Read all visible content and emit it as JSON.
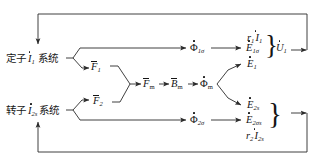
{
  "diagram": {
    "stroke_color": "#2b2b2b",
    "text_color": "#151515",
    "background": "#ffffff",
    "nodes": {
      "stator_system": {
        "label_prefix": "定子",
        "label_symbol": "I",
        "label_sub": "1",
        "label_suffix": "系统",
        "name": "stator-system-block"
      },
      "rotor_system": {
        "label_prefix": "转子",
        "label_symbol": "I",
        "label_sub": "2s",
        "label_suffix": "系统",
        "name": "rotor-system-block"
      },
      "f1": {
        "symbol": "F",
        "sub": "1"
      },
      "f2": {
        "symbol": "F",
        "sub": "2"
      },
      "fm": {
        "symbol": "F",
        "sub": "m"
      },
      "bm": {
        "symbol": "B",
        "sub": "m"
      },
      "phim": {
        "symbol": "Φ",
        "sub": "m"
      },
      "phi1s": {
        "symbol": "Φ",
        "sub": "1σ"
      },
      "phi2s": {
        "symbol": "Φ",
        "sub": "2σ"
      },
      "e1": {
        "symbol": "E",
        "sub": "1"
      },
      "e1s": {
        "symbol": "E",
        "sub": "1σ"
      },
      "e2s": {
        "symbol": "E",
        "sub": "2s"
      },
      "e2ss": {
        "symbol": "E",
        "sub": "2σs"
      },
      "r1i1": {
        "coef": "r",
        "coef_sub": "1",
        "symbol": "I",
        "sub": "1"
      },
      "r2i2s": {
        "coef": "r",
        "coef_sub": "2",
        "symbol": "I",
        "sub": "2s"
      },
      "u1": {
        "symbol": "U",
        "sub": "1"
      }
    },
    "groups": {
      "stator_voltage_brace": {
        "members": [
          "r1i1",
          "e1s",
          "e1"
        ],
        "result": "u1",
        "name": "stator-voltage-brace"
      },
      "rotor_voltage_brace": {
        "members": [
          "e2s",
          "e2ss",
          "r2i2s"
        ],
        "result": "",
        "name": "rotor-voltage-brace"
      }
    },
    "feedback": {
      "top_label": "stator voltage feedback loop",
      "bottom_label": "rotor circuit feedback loop"
    }
  }
}
